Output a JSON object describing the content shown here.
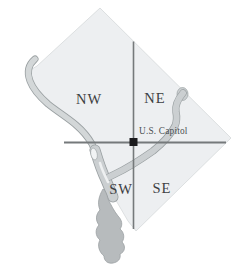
{
  "map": {
    "name": "Washington DC quadrant map",
    "labels": {
      "nw": "NW",
      "ne": "NE",
      "sw": "SW",
      "se": "SE",
      "capitol": "U.S. Capitol"
    },
    "colors": {
      "background": "#ffffff",
      "land": "#edeff1",
      "land_border": "#d5d9db",
      "river": "#d3d7d8",
      "river_mid": "#cbcfd1",
      "river_dark": "#b7bbbd",
      "river_outline": "#9aa0a2",
      "island": "#f1f3f4",
      "quadrant_line": "#75797b",
      "marker": "#1b1b1d",
      "label_text": "#3c4042",
      "capitol_text": "#4b5052"
    }
  }
}
